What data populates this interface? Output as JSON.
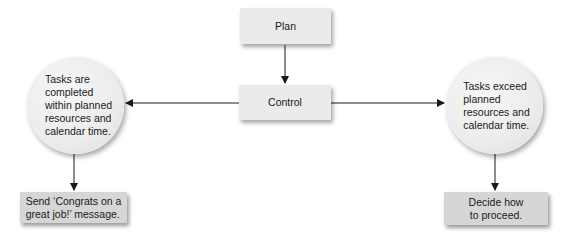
{
  "diagram": {
    "type": "flowchart",
    "nodes": {
      "plan": {
        "label": "Plan",
        "shape": "rectangle"
      },
      "control": {
        "label": "Control",
        "shape": "rectangle"
      },
      "within": {
        "label": "Tasks are\ncompleted\nwithin planned\nresources and\ncalendar time.",
        "shape": "circle"
      },
      "exceed": {
        "label": "Tasks exceed\nplanned\nresources and\ncalendar time.",
        "shape": "circle"
      },
      "congrats": {
        "label": "Send ‘Congrats on a\ngreat job!’ message.",
        "shape": "rectangle"
      },
      "decide": {
        "label": "Decide how\nto proceed.",
        "shape": "rectangle"
      }
    },
    "edges": [
      {
        "from": "plan",
        "to": "control"
      },
      {
        "from": "control",
        "to": "within"
      },
      {
        "from": "control",
        "to": "exceed"
      },
      {
        "from": "within",
        "to": "congrats"
      },
      {
        "from": "exceed",
        "to": "decide"
      }
    ],
    "colors": {
      "box_light": "#ebebeb",
      "box_dark": "#d6d6d6",
      "line": "#1a1a1a"
    }
  }
}
